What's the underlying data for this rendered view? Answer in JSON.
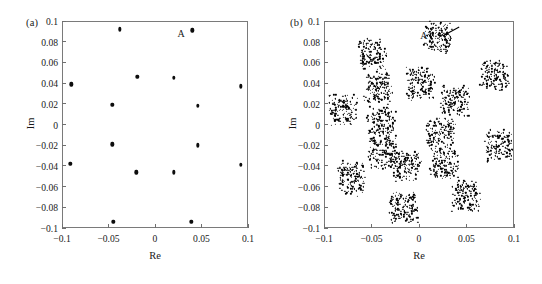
{
  "figure": {
    "background": "#ffffff",
    "marker_color": "#0d0d0d",
    "frame_color": "#7a7a7a"
  },
  "panels": [
    {
      "id": "a",
      "label": "(a)",
      "annotation_label": "A",
      "has_arrow": false
    },
    {
      "id": "b",
      "label": "(b)",
      "annotation_label": "A",
      "has_arrow": true
    }
  ],
  "chart_data": [
    {
      "type": "scatter",
      "title": "(a)",
      "xlabel": "Re",
      "ylabel": "Im",
      "xlim": [
        -0.1,
        0.1
      ],
      "ylim": [
        -0.1,
        0.1
      ],
      "xticks": [
        -0.1,
        -0.05,
        0,
        0.05,
        0.1
      ],
      "xticklabels": [
        "−0.1",
        "−0.05",
        "0",
        "0.05",
        "0.1"
      ],
      "yticks": [
        -0.1,
        -0.08,
        -0.06,
        -0.04,
        -0.02,
        0,
        0.02,
        0.04,
        0.06,
        0.08,
        0.1
      ],
      "yticklabels": [
        "−0.1",
        "−0.08",
        "−0.06",
        "−0.04",
        "−0.02",
        "0",
        "0.02",
        "0.04",
        "0.06",
        "0.08",
        "0.1"
      ],
      "grid": false,
      "legend": null,
      "series": [
        {
          "name": "constellation points",
          "points": [
            {
              "x": -0.038,
              "y": 0.092
            },
            {
              "x": 0.04,
              "y": 0.091
            },
            {
              "x": -0.09,
              "y": 0.039
            },
            {
              "x": -0.019,
              "y": 0.046
            },
            {
              "x": 0.02,
              "y": 0.045
            },
            {
              "x": 0.092,
              "y": 0.037
            },
            {
              "x": -0.046,
              "y": 0.019
            },
            {
              "x": 0.046,
              "y": 0.018
            },
            {
              "x": -0.046,
              "y": -0.019
            },
            {
              "x": 0.046,
              "y": -0.02
            },
            {
              "x": -0.091,
              "y": -0.038
            },
            {
              "x": -0.02,
              "y": -0.046
            },
            {
              "x": 0.02,
              "y": -0.046
            },
            {
              "x": 0.092,
              "y": -0.039
            },
            {
              "x": -0.045,
              "y": -0.094
            },
            {
              "x": 0.039,
              "y": -0.094
            }
          ]
        }
      ],
      "annotations": [
        {
          "text": "A",
          "x": 0.028,
          "y": 0.088
        }
      ]
    },
    {
      "type": "scatter",
      "title": "(b)",
      "xlabel": "Re",
      "ylabel": "Im",
      "xlim": [
        -0.1,
        0.1
      ],
      "ylim": [
        -0.1,
        0.1
      ],
      "xticks": [
        -0.1,
        -0.05,
        0,
        0.05,
        0.1
      ],
      "xticklabels": [
        "−0.1",
        "−0.05",
        "0",
        "0.05",
        "0.1"
      ],
      "yticks": [
        -0.1,
        -0.08,
        -0.06,
        -0.04,
        -0.02,
        0,
        0.02,
        0.04,
        0.06,
        0.08,
        0.1
      ],
      "yticklabels": [
        "−0.1",
        "−0.08",
        "−0.06",
        "−0.04",
        "−0.02",
        "0",
        "0.02",
        "0.04",
        "0.06",
        "0.08",
        "0.1"
      ],
      "grid": false,
      "legend": null,
      "cluster_radius": 0.0115,
      "points_per_cluster": 150,
      "series": [
        {
          "name": "noisy constellation clusters",
          "centers": [
            {
              "x": -0.05,
              "y": 0.069
            },
            {
              "x": 0.019,
              "y": 0.084
            },
            {
              "x": 0.079,
              "y": 0.049
            },
            {
              "x": -0.044,
              "y": 0.037
            },
            {
              "x": 0.001,
              "y": 0.041
            },
            {
              "x": 0.037,
              "y": 0.024
            },
            {
              "x": -0.081,
              "y": 0.015
            },
            {
              "x": -0.04,
              "y": 0.002
            },
            {
              "x": 0.022,
              "y": -0.008
            },
            {
              "x": 0.083,
              "y": -0.019
            },
            {
              "x": -0.039,
              "y": -0.027
            },
            {
              "x": -0.072,
              "y": -0.051
            },
            {
              "x": -0.013,
              "y": -0.04
            },
            {
              "x": 0.026,
              "y": -0.037
            },
            {
              "x": 0.049,
              "y": -0.068
            },
            {
              "x": -0.017,
              "y": -0.079
            }
          ]
        }
      ],
      "annotations": [
        {
          "text": "A",
          "x": 0.005,
          "y": 0.086
        },
        {
          "text": "arrow",
          "x_from": 0.042,
          "y_from": 0.094,
          "x_to": 0.026,
          "y_to": 0.086
        }
      ]
    }
  ]
}
